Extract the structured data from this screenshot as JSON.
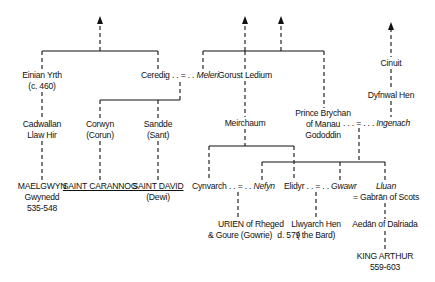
{
  "diagram": {
    "type": "genealogy-tree",
    "persons": {
      "einian": {
        "name": "Einian Yrth",
        "date": "(c. 460)"
      },
      "ceredig": {
        "name": "Ceredig",
        "join": ". . = . .",
        "spouse": "Meleri"
      },
      "gorust": {
        "name": "Gorust Ledium"
      },
      "cinuit": {
        "name": "Cinuit"
      },
      "dyfnwal": {
        "name": "Dyfnwal Hen"
      },
      "cadwallan": {
        "line1": "Cadwallan",
        "line2": "Llaw Hir"
      },
      "corwyn": {
        "line1": "Corwyn",
        "line2": "(Corun)"
      },
      "sandde": {
        "line1": "Sandde",
        "line2": "(Sant)"
      },
      "meirchaum": {
        "name": "Meirchaum"
      },
      "brychan": {
        "line1": "Prince Brychan",
        "line2": "of Manau",
        "line3": "Gododdin",
        "join": ". . . = . . .",
        "spouse": "Ingenach"
      },
      "maelgwyn": {
        "line1": "MAELGWYN",
        "line2": "Gwynedd",
        "line3": "535-548"
      },
      "carannog": {
        "name": "SAINT CARANNOG"
      },
      "david": {
        "name": "SAINT DAVID",
        "alt": "(Dewi)"
      },
      "cynvarch": {
        "name": "Cynvarch",
        "join": ". . = . .",
        "spouse": "Nefyn"
      },
      "elidyr": {
        "name": "Elidyr",
        "join": ". . = . .",
        "spouse": "Gwawr"
      },
      "lluan": {
        "name": "Lluan",
        "spouse_line": "= Gabrān of Scots"
      },
      "urien": {
        "line1": "URIEN of Rheged",
        "line2": "& Goure (Gowrie)",
        "death": "d. 579"
      },
      "llywarch": {
        "line1": "Llwyarch Hen",
        "line2": "( the Bard)"
      },
      "aedan": {
        "name": "Aedān of Dalriada"
      },
      "arthur": {
        "line1": "KING ARTHUR",
        "line2": "559-603"
      }
    }
  }
}
